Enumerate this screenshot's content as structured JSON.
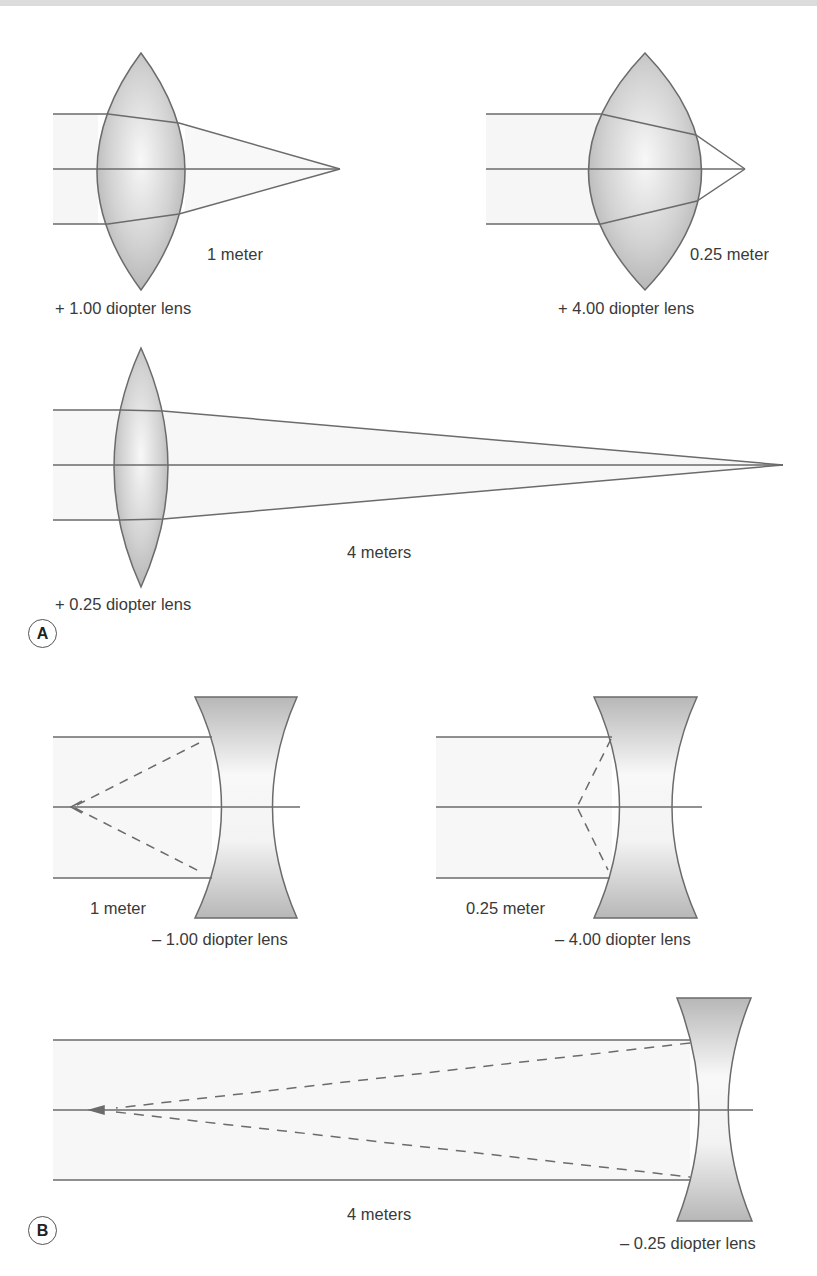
{
  "panels": {
    "A": {
      "badge": "A",
      "lenses": [
        {
          "type": "convex",
          "power_label": "+ 1.00 diopter lens",
          "distance_label": "1 meter"
        },
        {
          "type": "convex",
          "power_label": "+ 4.00 diopter lens",
          "distance_label": "0.25 meter"
        },
        {
          "type": "convex",
          "power_label": "+ 0.25 diopter lens",
          "distance_label": "4 meters"
        }
      ]
    },
    "B": {
      "badge": "B",
      "lenses": [
        {
          "type": "concave",
          "power_label": "– 1.00 diopter lens",
          "distance_label": "1 meter"
        },
        {
          "type": "concave",
          "power_label": "– 4.00 diopter lens",
          "distance_label": "0.25 meter"
        },
        {
          "type": "concave",
          "power_label": "– 0.25 diopter lens",
          "distance_label": "4 meters"
        }
      ]
    }
  },
  "colors": {
    "line": "#6b6b6b",
    "lens_fill_dark": "#b9b9b9",
    "lens_fill_light": "#f4f4f4",
    "beam": "#f6f6f6",
    "top_band": "#dcdcdc"
  }
}
